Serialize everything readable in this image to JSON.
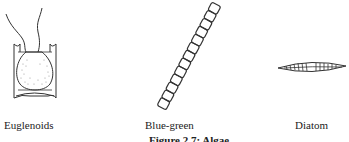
{
  "figure": {
    "caption": "Figure 2.7: Algae",
    "items": [
      {
        "name": "euglenoids",
        "label": "Euglenoids"
      },
      {
        "name": "blue-green",
        "label": "Blue-green"
      },
      {
        "name": "diatom",
        "label": "Diatom"
      }
    ]
  }
}
